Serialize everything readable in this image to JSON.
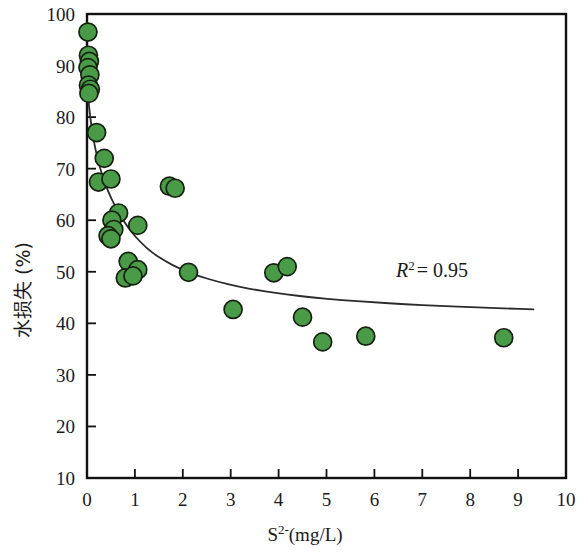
{
  "chart_data": {
    "type": "scatter",
    "title": "",
    "xlabel": "S2-(mg/L)",
    "xlabel_base": "S",
    "xlabel_sup": "2-",
    "xlabel_rest": "(mg/L)",
    "ylabel": "水损失 (%)",
    "xlim": [
      0,
      10
    ],
    "ylim": [
      10,
      100
    ],
    "xticks": [
      0,
      1,
      2,
      3,
      4,
      5,
      6,
      7,
      8,
      9,
      10
    ],
    "yticks": [
      10,
      20,
      30,
      40,
      50,
      60,
      70,
      80,
      90,
      100
    ],
    "xtick_labels": [
      "0",
      "1",
      "2",
      "3",
      "4",
      "5",
      "6",
      "7",
      "8",
      "9",
      "10"
    ],
    "ytick_labels": [
      "10",
      "20",
      "30",
      "40",
      "50",
      "60",
      "70",
      "80",
      "90",
      "100"
    ],
    "grid": false,
    "legend": null,
    "marker_color": "#4a9b48",
    "marker_edge_color": "#15210f",
    "marker_radius_px": 9,
    "curve_color": "#2b2b2b",
    "background": "#ffffff",
    "frame_color": "#111111",
    "annotations": [
      {
        "name": "r-squared",
        "text_base": "R",
        "text_sup": "2",
        "text_rest": "= 0.95",
        "full_text": "R2 = 0.95",
        "x": 6.45,
        "y": 50.2
      }
    ],
    "points": [
      {
        "x": 0.02,
        "y": 96.5
      },
      {
        "x": 0.03,
        "y": 92.0
      },
      {
        "x": 0.05,
        "y": 90.8
      },
      {
        "x": 0.02,
        "y": 89.6
      },
      {
        "x": 0.06,
        "y": 88.2
      },
      {
        "x": 0.03,
        "y": 86.2
      },
      {
        "x": 0.07,
        "y": 85.4
      },
      {
        "x": 0.04,
        "y": 84.6
      },
      {
        "x": 0.2,
        "y": 77.0
      },
      {
        "x": 0.36,
        "y": 72.0
      },
      {
        "x": 0.24,
        "y": 67.4
      },
      {
        "x": 0.5,
        "y": 68.0
      },
      {
        "x": 0.66,
        "y": 61.4
      },
      {
        "x": 0.52,
        "y": 60.0
      },
      {
        "x": 0.56,
        "y": 58.2
      },
      {
        "x": 0.44,
        "y": 57.0
      },
      {
        "x": 0.5,
        "y": 56.4
      },
      {
        "x": 1.06,
        "y": 59.0
      },
      {
        "x": 1.72,
        "y": 66.6
      },
      {
        "x": 1.84,
        "y": 66.2
      },
      {
        "x": 0.86,
        "y": 52.0
      },
      {
        "x": 1.06,
        "y": 50.4
      },
      {
        "x": 0.8,
        "y": 48.8
      },
      {
        "x": 0.96,
        "y": 49.2
      },
      {
        "x": 2.12,
        "y": 49.9
      },
      {
        "x": 3.05,
        "y": 42.7
      },
      {
        "x": 3.9,
        "y": 49.8
      },
      {
        "x": 4.18,
        "y": 51.0
      },
      {
        "x": 4.5,
        "y": 41.2
      },
      {
        "x": 4.92,
        "y": 36.4
      },
      {
        "x": 5.82,
        "y": 37.5
      },
      {
        "x": 8.7,
        "y": 37.2
      }
    ],
    "fit_curve": {
      "name": "power-decay-fit",
      "description": "decreasing power fit through scatter",
      "x_start": 0.03,
      "x_end": 9.32,
      "points": [
        {
          "x": 0.03,
          "y": 83.2
        },
        {
          "x": 0.08,
          "y": 79.0
        },
        {
          "x": 0.14,
          "y": 75.4
        },
        {
          "x": 0.22,
          "y": 71.9
        },
        {
          "x": 0.32,
          "y": 68.6
        },
        {
          "x": 0.44,
          "y": 65.6
        },
        {
          "x": 0.58,
          "y": 62.8
        },
        {
          "x": 0.74,
          "y": 60.2
        },
        {
          "x": 0.92,
          "y": 57.8
        },
        {
          "x": 1.12,
          "y": 55.7
        },
        {
          "x": 1.36,
          "y": 53.7
        },
        {
          "x": 1.64,
          "y": 52.0
        },
        {
          "x": 1.96,
          "y": 50.5
        },
        {
          "x": 2.32,
          "y": 49.2
        },
        {
          "x": 2.72,
          "y": 48.1
        },
        {
          "x": 3.16,
          "y": 47.1
        },
        {
          "x": 3.64,
          "y": 46.3
        },
        {
          "x": 4.16,
          "y": 45.6
        },
        {
          "x": 4.72,
          "y": 45.0
        },
        {
          "x": 5.32,
          "y": 44.5
        },
        {
          "x": 5.96,
          "y": 44.1
        },
        {
          "x": 6.64,
          "y": 43.7
        },
        {
          "x": 7.36,
          "y": 43.4
        },
        {
          "x": 8.12,
          "y": 43.1
        },
        {
          "x": 8.72,
          "y": 42.9
        },
        {
          "x": 9.32,
          "y": 42.7
        }
      ]
    }
  }
}
